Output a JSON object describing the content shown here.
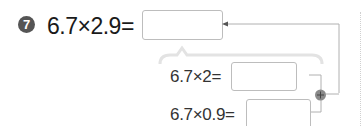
{
  "problem": {
    "number": "7",
    "expression": "6.7×2.9=",
    "answer_box": ""
  },
  "steps": [
    {
      "expression": "6.7×2=",
      "answer_box": ""
    },
    {
      "expression": "6.7×0.9=",
      "answer_box": ""
    }
  ],
  "connector": {
    "operator_icon": "plus-circle-icon",
    "arrow_icon": "arrow-left-icon"
  },
  "colors": {
    "badge": "#555555",
    "box_border": "#bdbdbd",
    "line": "#b0b0b0",
    "bracket": "#e3e3e3"
  }
}
